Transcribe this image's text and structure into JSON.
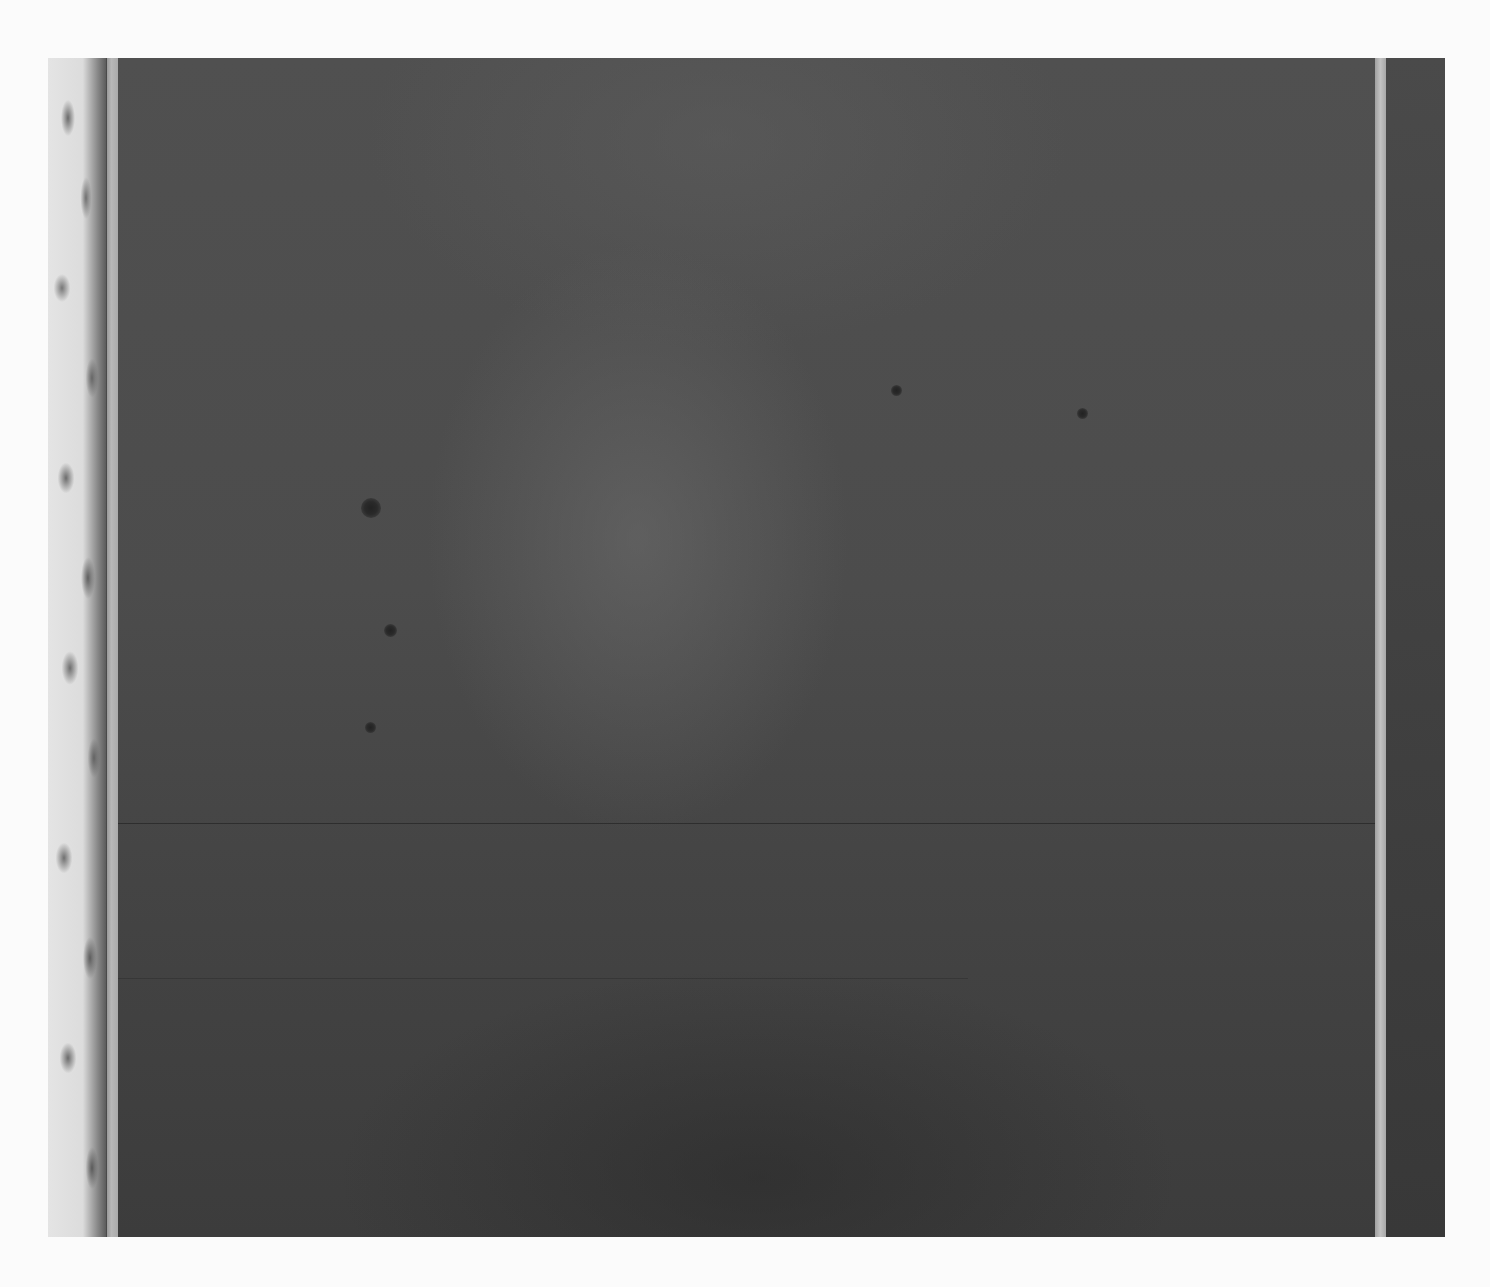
{
  "image": {
    "subject": "Abstract painting with dark gray field and two vertical light stripes",
    "colors": {
      "background": "#fbfbfb",
      "field": "#4a4a4a",
      "field_dark": "#3c3c3c",
      "stripe_light": "#b8b8b8",
      "left_strip_light": "#e0e0e0",
      "right_band": "#3f3f3f"
    },
    "elements": [
      {
        "name": "textured-left-strip",
        "color": "#e0e0e0"
      },
      {
        "name": "left-light-stripe",
        "color": "#b0b0b0"
      },
      {
        "name": "dark-field",
        "color": "#4a4a4a"
      },
      {
        "name": "right-light-stripe",
        "color": "#b8b8b8"
      },
      {
        "name": "right-dark-band",
        "color": "#3f3f3f"
      }
    ],
    "spots": [
      {
        "x": 371,
        "y": 507,
        "r": 9
      },
      {
        "x": 391,
        "y": 630,
        "r": 6
      },
      {
        "x": 371,
        "y": 727,
        "r": 5
      },
      {
        "x": 897,
        "y": 390,
        "r": 5
      },
      {
        "x": 1083,
        "y": 413,
        "r": 5
      }
    ]
  }
}
